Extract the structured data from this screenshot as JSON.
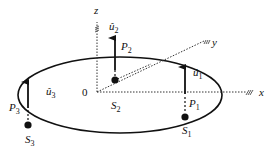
{
  "diagram": {
    "axes": {
      "x": "x",
      "y": "y",
      "z": "z",
      "origin": "0"
    },
    "points": [
      {
        "name": "P",
        "sub": "1"
      },
      {
        "name": "P",
        "sub": "2"
      },
      {
        "name": "P",
        "sub": "3"
      }
    ],
    "sources": [
      {
        "name": "S",
        "sub": "1"
      },
      {
        "name": "S",
        "sub": "2"
      },
      {
        "name": "S",
        "sub": "3"
      }
    ],
    "vectors": [
      {
        "name": "û",
        "sub": "1"
      },
      {
        "name": "û",
        "sub": "2"
      },
      {
        "name": "û",
        "sub": "3"
      }
    ],
    "colors": {
      "ink": "#111111"
    }
  }
}
